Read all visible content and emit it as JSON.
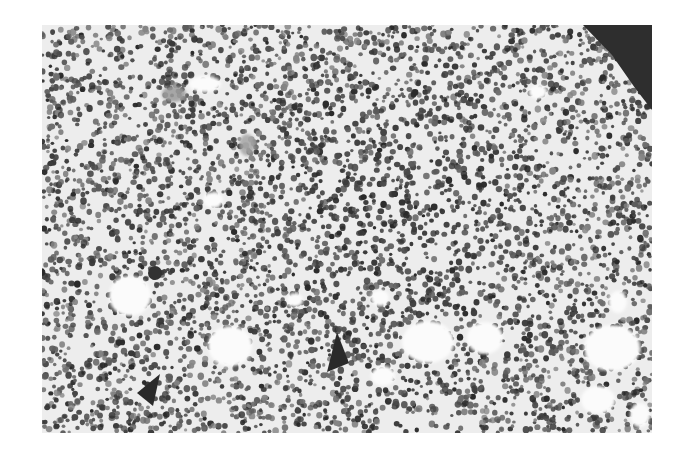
{
  "image": {
    "kind": "grayscale light micrograph",
    "subject": "densely cellular hematopoietic tissue with scattered clear fat vacuoles",
    "canvas": {
      "width": 682,
      "height": 462,
      "background": "#ffffff"
    },
    "frame": {
      "x": 42,
      "y": 25,
      "width": 610,
      "height": 408,
      "tissue_color": "#ededed"
    },
    "nuclei": {
      "count": 5200,
      "radius_min": 1.6,
      "radius_max": 3.4,
      "colors": [
        "#2b2b2b",
        "#3a3a3a",
        "#4a4a4a",
        "#5c5c5c",
        "#6e6e6e",
        "#858585"
      ],
      "dense_center": {
        "x": 400,
        "y": 230,
        "radius": 180
      }
    },
    "dark_corner": {
      "color": "#2e2e2e",
      "points": [
        [
          583,
          25
        ],
        [
          652,
          25
        ],
        [
          652,
          110
        ],
        [
          635,
          88
        ],
        [
          612,
          55
        ]
      ]
    },
    "vacuoles": [
      {
        "x": 130,
        "y": 296,
        "rx": 21,
        "ry": 20
      },
      {
        "x": 230,
        "y": 346,
        "rx": 22,
        "ry": 20
      },
      {
        "x": 428,
        "y": 342,
        "rx": 26,
        "ry": 21
      },
      {
        "x": 485,
        "y": 338,
        "rx": 18,
        "ry": 16
      },
      {
        "x": 612,
        "y": 348,
        "rx": 28,
        "ry": 23
      },
      {
        "x": 383,
        "y": 376,
        "rx": 12,
        "ry": 10
      },
      {
        "x": 598,
        "y": 400,
        "rx": 17,
        "ry": 14
      },
      {
        "x": 380,
        "y": 298,
        "rx": 9,
        "ry": 8
      },
      {
        "x": 205,
        "y": 84,
        "rx": 16,
        "ry": 8
      },
      {
        "x": 213,
        "y": 200,
        "rx": 10,
        "ry": 8
      },
      {
        "x": 538,
        "y": 92,
        "rx": 9,
        "ry": 7
      },
      {
        "x": 618,
        "y": 302,
        "rx": 9,
        "ry": 11
      },
      {
        "x": 295,
        "y": 300,
        "rx": 8,
        "ry": 7
      },
      {
        "x": 640,
        "y": 415,
        "rx": 10,
        "ry": 12
      }
    ],
    "pale_blobs": [
      {
        "x": 174,
        "y": 94,
        "rx": 12,
        "ry": 8,
        "color": "#9a9a9a"
      },
      {
        "x": 247,
        "y": 145,
        "rx": 8,
        "ry": 11,
        "color": "#a5a5a5"
      }
    ],
    "arrowheads": [
      {
        "label": "arrowhead-center",
        "tip": [
          337,
          332
        ],
        "base_left": [
          327,
          372
        ],
        "base_right": [
          349,
          363
        ],
        "color": "#2a2a2a"
      },
      {
        "label": "arrowhead-lower-left",
        "tip": [
          160,
          374
        ],
        "base_left": [
          137,
          393
        ],
        "base_right": [
          153,
          406
        ],
        "color": "#2a2a2a"
      }
    ],
    "dark_cluster": {
      "x": 155,
      "y": 273,
      "r": 7,
      "color": "#303030"
    }
  },
  "caption": {
    "alt_text": "Grayscale histology micrograph of hypercellular marrow-like tissue with fat vacuoles and two black arrowheads"
  }
}
